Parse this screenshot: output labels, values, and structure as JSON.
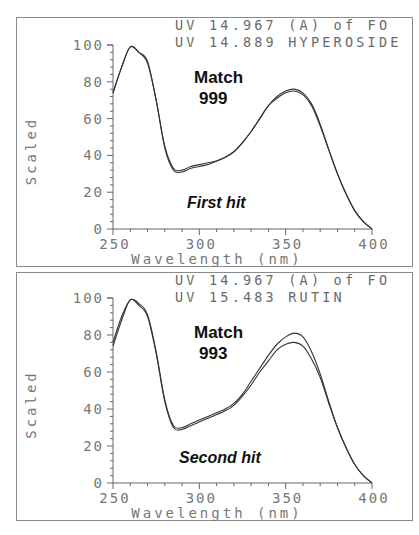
{
  "chart_data": [
    {
      "type": "line",
      "panel_label": "First hit",
      "header_lines": [
        "UV 14.967 (A) of FO",
        "UV 14.889 HYPEROSIDE"
      ],
      "match_label": "Match",
      "match_score": "999",
      "xlabel": "Wavelength (nm)",
      "ylabel": "Scaled",
      "xlim": [
        250,
        400
      ],
      "ylim": [
        0,
        100
      ],
      "x_ticks": [
        250,
        300,
        350,
        400
      ],
      "y_ticks": [
        0,
        20,
        40,
        60,
        80,
        100
      ],
      "x_tick_labels": [
        "250",
        "300",
        "350",
        "400"
      ],
      "y_tick_labels": [
        "0",
        "20",
        "40",
        "60",
        "80",
        "100"
      ],
      "grid": false,
      "legend": null,
      "x": [
        250,
        255,
        260,
        265,
        270,
        275,
        280,
        285,
        290,
        295,
        300,
        305,
        310,
        315,
        320,
        325,
        330,
        335,
        340,
        345,
        350,
        355,
        360,
        365,
        370,
        375,
        380,
        385,
        390,
        395,
        400
      ],
      "series": [
        {
          "name": "UV 14.967 (A) of FO",
          "values": [
            74,
            88,
            99,
            96,
            90,
            70,
            44,
            32,
            31,
            33,
            34,
            35,
            37,
            39,
            42,
            47,
            53,
            60,
            67,
            72,
            75,
            76,
            74,
            68,
            57,
            43,
            30,
            19,
            10,
            4,
            0
          ]
        },
        {
          "name": "UV 14.889 HYPEROSIDE",
          "values": [
            74,
            88,
            99,
            96,
            91,
            70,
            45,
            33,
            32,
            34,
            35,
            36,
            37,
            39,
            42,
            47,
            53,
            60,
            67,
            71,
            74,
            75,
            73,
            67,
            56,
            43,
            30,
            19,
            10,
            4,
            0
          ]
        }
      ]
    },
    {
      "type": "line",
      "panel_label": "Second hit",
      "header_lines": [
        "UV 14.967 (A) of FO",
        "UV 15.483 RUTIN"
      ],
      "match_label": "Match",
      "match_score": "993",
      "xlabel": "Wavelength (nm)",
      "ylabel": "Scaled",
      "xlim": [
        250,
        400
      ],
      "ylim": [
        0,
        100
      ],
      "x_ticks": [
        250,
        300,
        350,
        400
      ],
      "y_ticks": [
        0,
        20,
        40,
        60,
        80,
        100
      ],
      "x_tick_labels": [
        "250",
        "300",
        "350",
        "400"
      ],
      "y_tick_labels": [
        "0",
        "20",
        "40",
        "60",
        "80",
        "100"
      ],
      "grid": false,
      "legend": null,
      "x": [
        250,
        255,
        260,
        265,
        270,
        275,
        280,
        285,
        290,
        295,
        300,
        305,
        310,
        315,
        320,
        325,
        330,
        335,
        340,
        345,
        350,
        355,
        360,
        365,
        370,
        375,
        380,
        385,
        390,
        395,
        400
      ],
      "series": [
        {
          "name": "UV 14.967 (A) of FO",
          "values": [
            74,
            88,
            99,
            96,
            90,
            70,
            44,
            30,
            29,
            31,
            33,
            35,
            37,
            39,
            42,
            47,
            53,
            60,
            66,
            72,
            75,
            76,
            74,
            67,
            57,
            43,
            30,
            19,
            10,
            4,
            0
          ]
        },
        {
          "name": "UV 15.483 RUTIN",
          "values": [
            76,
            90,
            99,
            97,
            91,
            71,
            45,
            31,
            30,
            32,
            34,
            36,
            38,
            40,
            43,
            48,
            55,
            62,
            69,
            75,
            79,
            81,
            79,
            71,
            59,
            44,
            30,
            19,
            10,
            4,
            0
          ]
        }
      ]
    }
  ],
  "colors": {
    "curve": "#333333",
    "axis": "#666666",
    "header_text": "#6a6a6a",
    "annotation_text": "#111111",
    "border": "#8a8a8a"
  }
}
